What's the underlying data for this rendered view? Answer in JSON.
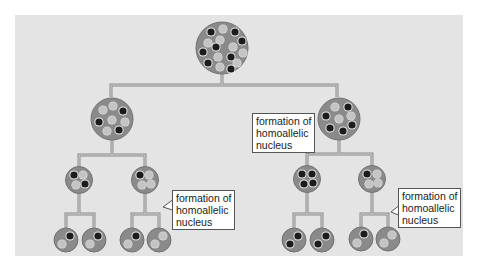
{
  "diagram": {
    "type": "nuclear division lineage tree",
    "colors": {
      "background": "#e4e4e4",
      "nucleus": "#8a8a8a",
      "nucleus_outline": "#6e6e6e",
      "allele_dark": "#1c1c1c",
      "allele_light": "#c9c9c9",
      "line": "#8c8c8c"
    },
    "levels": [
      {
        "level": 1,
        "nuclei": [
          {
            "id": "root",
            "dark": 7,
            "light": 9
          }
        ]
      },
      {
        "level": 2,
        "nuclei": [
          {
            "id": "L",
            "dark": 3,
            "light": 5
          },
          {
            "id": "R",
            "dark": 5,
            "light": 3
          }
        ]
      },
      {
        "level": 3,
        "nuclei": [
          {
            "id": "LL",
            "dark": 2,
            "light": 2
          },
          {
            "id": "LR",
            "dark": 1,
            "light": 3
          },
          {
            "id": "RL",
            "dark": 4,
            "light": 0
          },
          {
            "id": "RR",
            "dark": 1,
            "light": 3
          }
        ]
      },
      {
        "level": 4,
        "nuclei": [
          {
            "id": "LLa",
            "dark": 1,
            "light": 1
          },
          {
            "id": "LLb",
            "dark": 1,
            "light": 1
          },
          {
            "id": "LRa",
            "dark": 1,
            "light": 1
          },
          {
            "id": "LRb",
            "dark": 0,
            "light": 2
          },
          {
            "id": "RLa",
            "dark": 2,
            "light": 0
          },
          {
            "id": "RLb",
            "dark": 2,
            "light": 0
          },
          {
            "id": "RRa",
            "dark": 1,
            "light": 1
          },
          {
            "id": "RRb",
            "dark": 0,
            "light": 2
          }
        ]
      }
    ],
    "labels": [
      {
        "id": "label-1",
        "text": "formation of\nhomoallelic\nnucleus",
        "points_to": "RL"
      },
      {
        "id": "label-2",
        "text": "formation of\nhomoallelic\nnucleus",
        "points_to": "LRb"
      },
      {
        "id": "label-3",
        "text": "formation of\nhomoallelic\nnucleus",
        "points_to": "RRb"
      }
    ]
  }
}
